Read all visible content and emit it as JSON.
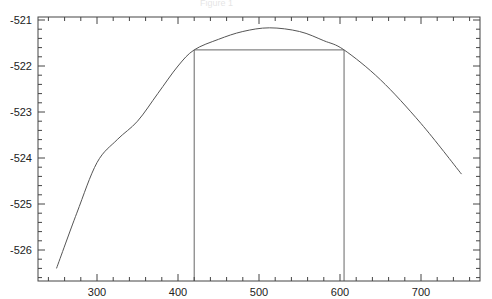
{
  "figure": {
    "title": "Figure 1"
  },
  "chart_data": {
    "type": "line",
    "title": "",
    "xlabel": "",
    "ylabel": "",
    "xlim": [
      230,
      765
    ],
    "ylim": [
      -526.67,
      -520.93
    ],
    "grid": false,
    "legend": null,
    "x_ticks": [
      300,
      400,
      500,
      600,
      700
    ],
    "x_tick_labels": [
      "300",
      "400",
      "500",
      "600",
      "700"
    ],
    "y_ticks": [
      -521,
      -522,
      -523,
      -524,
      -525,
      -526
    ],
    "y_tick_labels": [
      "-521",
      "-522",
      "-523",
      "-524",
      "-525",
      "-526"
    ],
    "series": [
      {
        "name": "curve",
        "color": "#555555",
        "x": [
          250,
          275,
          300,
          325,
          350,
          375,
          400,
          420,
          450,
          480,
          513,
          550,
          580,
          605,
          650,
          700,
          750
        ],
        "y": [
          -526.4,
          -525.2,
          -524.1,
          -523.6,
          -523.2,
          -522.6,
          -522.0,
          -521.65,
          -521.42,
          -521.25,
          -521.17,
          -521.25,
          -521.45,
          -521.65,
          -522.3,
          -523.25,
          -524.35
        ]
      }
    ],
    "annotations": [
      {
        "type": "vline",
        "x": 420,
        "y_from": -526.67,
        "y_to": -521.65,
        "color": "#666666"
      },
      {
        "type": "vline",
        "x": 605,
        "y_from": -526.67,
        "y_to": -521.65,
        "color": "#666666"
      },
      {
        "type": "hline",
        "y": -521.65,
        "x_from": 420,
        "x_to": 605,
        "color": "#666666"
      }
    ]
  },
  "style": {
    "axis_color": "#444444",
    "line_color": "#555555",
    "background": "#ffffff"
  }
}
